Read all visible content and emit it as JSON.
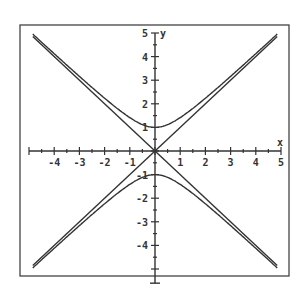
{
  "chart_data": {
    "type": "line",
    "title": "",
    "xlabel": "x",
    "ylabel": "y",
    "xlim": [
      -5,
      5
    ],
    "ylim": [
      -5,
      5
    ],
    "x_ticks": [
      -4,
      -3,
      -2,
      -1,
      1,
      2,
      3,
      4,
      5
    ],
    "y_ticks": [
      5,
      4,
      3,
      2,
      1,
      -1,
      -2,
      -3,
      -4
    ],
    "grid": false,
    "legend": null,
    "series": [
      {
        "name": "hyperbola upper branch (y = sqrt(x^2+1))",
        "x": [
          -5,
          -4,
          -3,
          -2,
          -1,
          0,
          1,
          2,
          3,
          4,
          5
        ],
        "y": [
          5.1,
          4.12,
          3.16,
          2.24,
          1.41,
          1,
          1.41,
          2.24,
          3.16,
          4.12,
          5.1
        ]
      },
      {
        "name": "hyperbola lower branch (y = -sqrt(x^2+1))",
        "x": [
          -5,
          -4,
          -3,
          -2,
          -1,
          0,
          1,
          2,
          3,
          4,
          5
        ],
        "y": [
          -5.1,
          -4.12,
          -3.16,
          -2.24,
          -1.41,
          -1,
          -1.41,
          -2.24,
          -3.16,
          -4.12,
          -5.1
        ]
      },
      {
        "name": "asymptote y = x",
        "x": [
          -5,
          5
        ],
        "y": [
          -5,
          5
        ]
      },
      {
        "name": "asymptote y = -x",
        "x": [
          -5,
          5
        ],
        "y": [
          5,
          -5
        ]
      }
    ]
  },
  "axes": {
    "x_label": "x",
    "y_label": "y",
    "x_tick_labels": [
      "-4",
      "-3",
      "-2",
      "-1",
      "1",
      "2",
      "3",
      "4",
      "5"
    ],
    "y_tick_labels": [
      "5",
      "4",
      "3",
      "2",
      "1",
      "-1",
      "-2",
      "-3",
      "-4"
    ]
  }
}
